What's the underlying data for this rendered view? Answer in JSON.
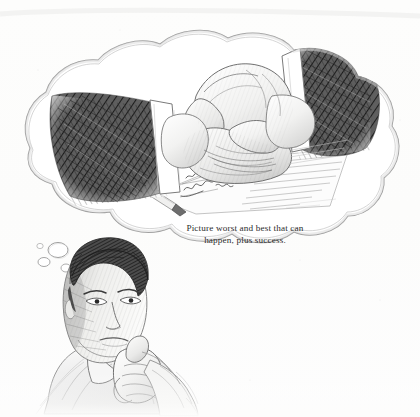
{
  "image": {
    "title": "Thinking man with handshake thought bubble",
    "medium": "pencil sketch illustration",
    "width": 420,
    "height": 417,
    "background_color": "#fdfdfc",
    "graphite_dark": "#3a3a3a",
    "graphite_mid": "#6e6e6e",
    "graphite_light": "#b9b9b9",
    "outline_color": "#8a8a8a"
  },
  "caption": {
    "line1": "Picture worst and best that can",
    "line2": "happen, plus success.",
    "full_text": "Picture worst and best that can happen, plus success.",
    "color": "#2c2c2c",
    "align": "center"
  },
  "scene": {
    "thought_bubble": {
      "name": "cloud-shaped thought bubble",
      "contents": "two hands clasped in a handshake above a signed document with a pen"
    },
    "thinker": {
      "name": "man in thinking pose",
      "description": "young man with dark hair, hand resting on chin, wearing an open-collar shirt"
    },
    "trail_bubbles": {
      "count": 3,
      "description": "three small round bubbles rising from the man's head to the cloud"
    },
    "handshake": {
      "left_arm": "dark cross-hatched suit sleeve with white shirt cuff",
      "right_arm": "dark cross-hatched suit sleeve with white shirt cuff",
      "document": "sheet of paper with handwritten signature lines",
      "pen": "pen lying across the document"
    }
  }
}
